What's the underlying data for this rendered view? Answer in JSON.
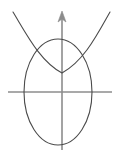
{
  "figure": {
    "canvas": {
      "width": 119,
      "height": 154,
      "background": "#ffffff"
    },
    "colors": {
      "axis": "#8c8c8c",
      "curve": "#4a4a4a",
      "background": "#ffffff"
    },
    "origin": {
      "x": 62,
      "y": 92
    },
    "axes": {
      "horizontal": {
        "label": "x-axis",
        "y": 92,
        "x_start": 8,
        "x_end": 112,
        "stroke_width": 1.6,
        "arrowhead": false
      },
      "vertical": {
        "label": "y-axis",
        "x": 62,
        "y_start": 150,
        "y_end": 14,
        "stroke_width": 1.6,
        "arrowhead": true,
        "arrow_tip": {
          "x": 62,
          "y": 11
        },
        "arrow_half_width": 4,
        "arrow_length": 11
      }
    },
    "shapes": [
      {
        "name": "ellipse",
        "type": "ellipse",
        "center": {
          "x": 58,
          "y": 92
        },
        "rx": 34,
        "ry": 53,
        "stroke": "#4a4a4a",
        "stroke_width": 1.1,
        "path": "M 24 92 A 34 53 0 1 1 92 92 A 34 53 0 1 1 24 92 Z"
      },
      {
        "name": "parabola",
        "type": "parabola",
        "opens": "up",
        "vertex": {
          "x": 62,
          "y": 73
        },
        "left_end": {
          "x": 13,
          "y": 12
        },
        "right_end": {
          "x": 110,
          "y": 12
        },
        "stroke": "#4a4a4a",
        "stroke_width": 1.1,
        "path": "M 13 12 C 27 35 40 61 62 73 C 84 61 97 35 110 12"
      }
    ],
    "intersections": [
      {
        "name": "left-intersection",
        "x": 37,
        "y": 55
      },
      {
        "name": "right-intersection",
        "x": 86,
        "y": 55
      }
    ]
  },
  "chart_data": {
    "type": "line",
    "xlabel": "",
    "ylabel": "",
    "grid": false,
    "legend": "none",
    "xlim": [
      -62,
      57
    ],
    "ylim": [
      -58,
      92
    ],
    "series": [
      {
        "name": "ellipse",
        "description": "Ellipse centered slightly left of origin, semi-axis a = 34, semi-axis b = 53",
        "center": [
          -4,
          0
        ],
        "a": 34,
        "b": 53
      },
      {
        "name": "parabola",
        "description": "Upward-opening parabola with vertex above the origin",
        "vertex": [
          0,
          19
        ],
        "points": [
          [
            -49,
            80
          ],
          [
            -35,
            57
          ],
          [
            -22,
            31
          ],
          [
            0,
            19
          ],
          [
            22,
            31
          ],
          [
            35,
            57
          ],
          [
            48,
            80
          ]
        ]
      }
    ],
    "annotations": [
      {
        "label": "left intersection",
        "x": -25,
        "y": 37
      },
      {
        "label": "right intersection",
        "x": 24,
        "y": 37
      }
    ]
  }
}
